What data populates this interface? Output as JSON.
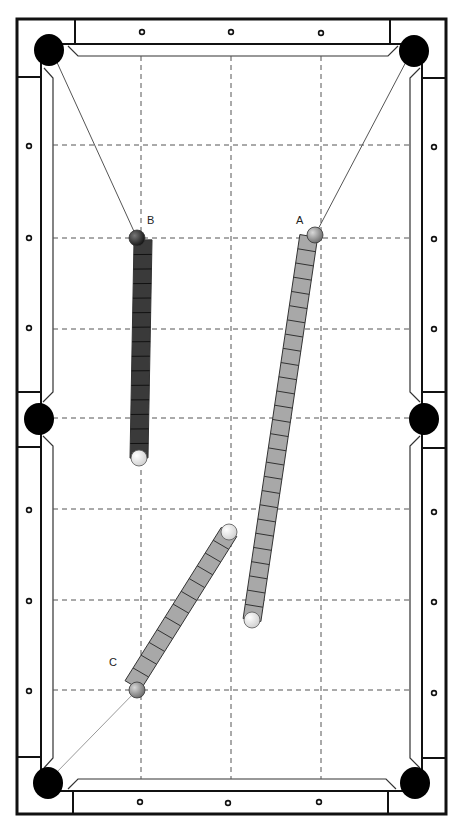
{
  "diagram": {
    "colors": {
      "line": "#111111",
      "grid": "#555555",
      "pocket": "#000000",
      "object_ball_dark": "#222222",
      "object_ball_grey": "#8a8a8a",
      "cue_ball": "#f4f4f4",
      "path_dark": "#3a3a3a",
      "path_light": "#a8a8a8"
    },
    "grid": {
      "x": [
        141,
        231,
        321
      ],
      "y": [
        145,
        238,
        329,
        418,
        509,
        600,
        690
      ]
    },
    "diamonds": {
      "top": [
        [
          142,
          32
        ],
        [
          231,
          32
        ],
        [
          321,
          33
        ]
      ],
      "bottom": [
        [
          140,
          802
        ],
        [
          228,
          803
        ],
        [
          319,
          802
        ]
      ],
      "left": [
        [
          29,
          146
        ],
        [
          29,
          238
        ],
        [
          29,
          328
        ],
        [
          29,
          510
        ],
        [
          29,
          601
        ],
        [
          29,
          691
        ]
      ],
      "right": [
        [
          434,
          147
        ],
        [
          434,
          239
        ],
        [
          434,
          329
        ],
        [
          434,
          512
        ],
        [
          434,
          602
        ],
        [
          434,
          693
        ]
      ]
    },
    "pockets": [
      {
        "name": "top-left",
        "cx": 49,
        "cy": 50
      },
      {
        "name": "top-right",
        "cx": 414,
        "cy": 51
      },
      {
        "name": "middle-left",
        "cx": 39,
        "cy": 419
      },
      {
        "name": "middle-right",
        "cx": 424,
        "cy": 419
      },
      {
        "name": "bottom-left",
        "cx": 48,
        "cy": 783
      },
      {
        "name": "bottom-right",
        "cx": 415,
        "cy": 783
      }
    ],
    "shots": [
      {
        "label": "B",
        "object_ball": {
          "cx": 137,
          "cy": 238,
          "color": "dark"
        },
        "cue_ball": {
          "cx": 139,
          "cy": 458
        },
        "aim_line": {
          "x1": 137,
          "y1": 238,
          "x2": 55,
          "y2": 58
        },
        "path_style": "dark",
        "segments": 15,
        "label_pos": {
          "x": 147,
          "y": 224
        }
      },
      {
        "label": "A",
        "object_ball": {
          "cx": 315,
          "cy": 235,
          "color": "grey"
        },
        "cue_ball": {
          "cx": 252,
          "cy": 620
        },
        "aim_line": {
          "x1": 315,
          "y1": 235,
          "x2": 408,
          "y2": 58
        },
        "path_style": "light",
        "segments": 27,
        "label_pos": {
          "x": 296,
          "y": 224
        }
      },
      {
        "label": "C",
        "object_ball": {
          "cx": 137,
          "cy": 690,
          "color": "grey"
        },
        "cue_ball": {
          "cx": 229,
          "cy": 532
        },
        "aim_line": {
          "x1": 137,
          "y1": 690,
          "x2": 55,
          "y2": 774
        },
        "path_style": "light",
        "segments": 12,
        "label_pos": {
          "x": 109,
          "y": 666
        }
      }
    ]
  }
}
